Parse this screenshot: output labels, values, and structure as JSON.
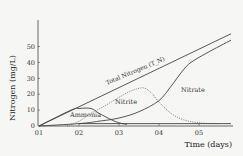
{
  "chart_data": {
    "type": "line",
    "title": "",
    "xlabel": "Time (days)",
    "ylabel": "Nitrogen (mg/L)",
    "x_ticks": [
      "01",
      "02",
      "03",
      "04",
      "05"
    ],
    "y_ticks": [
      "0",
      "10",
      "20",
      "30",
      "40",
      "50"
    ],
    "xlim": [
      1,
      5.8
    ],
    "ylim": [
      0,
      60
    ],
    "grid": false,
    "legend": "inline labels",
    "series": [
      {
        "name": "Total Nitrogen (T_N)",
        "style": "solid",
        "x": [
          1,
          5.8
        ],
        "y": [
          0,
          58
        ]
      },
      {
        "name": "Ammonia",
        "style": "solid",
        "x": [
          1,
          1.8,
          2.0,
          2.3,
          2.5,
          2.8,
          3.0,
          3.2
        ],
        "y": [
          0,
          10,
          11,
          11,
          8,
          4,
          2,
          1
        ]
      },
      {
        "name": "Nitrite",
        "style": "dotted",
        "x": [
          1.7,
          2.0,
          2.3,
          2.6,
          3.0,
          3.3,
          3.6,
          3.8,
          4.0,
          4.3,
          4.6,
          5.0,
          5.5
        ],
        "y": [
          0,
          3,
          8,
          12,
          18,
          22,
          24,
          21,
          15,
          8,
          4,
          2,
          1.5
        ]
      },
      {
        "name": "Nitrate",
        "style": "solid",
        "x": [
          1,
          2.0,
          2.5,
          3.0,
          3.5,
          4.0,
          4.3,
          4.6,
          4.8,
          5.2,
          5.8
        ],
        "y": [
          0,
          1.5,
          3,
          5,
          9,
          16,
          25,
          35,
          40,
          46,
          54
        ]
      },
      {
        "name": "Baseline",
        "style": "solid",
        "x": [
          2,
          5.8
        ],
        "y": [
          1.5,
          1.5
        ]
      }
    ],
    "annotations": [
      "Total Nitrogen (T_N)",
      "Ammonia",
      "Nitrite",
      "Nitrate"
    ]
  },
  "labels": {
    "ylabel": "Nitrogen (mg/L)",
    "xlabel": "Time (days)",
    "total": "Total Nitrogen (T_N)",
    "ammonia": "Ammonia",
    "nitrite": "Nitrite",
    "nitrate": "Nitrate"
  },
  "colors": {
    "line": "#444444",
    "dotted": "#555555",
    "background": "#f6f6f4"
  }
}
